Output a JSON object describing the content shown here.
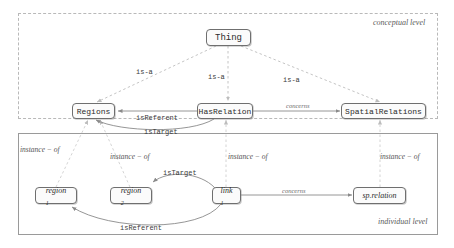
{
  "diagram": {
    "title_domain": "ontology-two-level-diagram",
    "colors": {
      "node_border": "#6f6f6f",
      "node_fill": "#fbfbfb",
      "solid_edge": "#8a8a8a",
      "dashed_edge": "#bdbdbd",
      "caption_text": "#5a5a5a",
      "label_text": "#3a3a3a"
    }
  },
  "levels": [
    {
      "id": "conceptual",
      "caption": "conceptual level",
      "border": "dashed"
    },
    {
      "id": "individual",
      "caption": "individual level",
      "border": "solid"
    }
  ],
  "conceptual": {
    "nodes": [
      {
        "id": "thing",
        "label": "Thing"
      },
      {
        "id": "regions",
        "label": "Regions"
      },
      {
        "id": "hasrelation",
        "label": "HasRelation"
      },
      {
        "id": "spatialrelations",
        "label": "SpatialRelations"
      }
    ],
    "edges": [
      {
        "id": "isa-regions",
        "label": "is-a",
        "style": "dashed",
        "from": "thing",
        "to": "regions"
      },
      {
        "id": "isa-hasrel",
        "label": "is-a",
        "style": "dashed",
        "from": "thing",
        "to": "hasrelation"
      },
      {
        "id": "isa-spatial",
        "label": "is-a",
        "style": "dashed",
        "from": "thing",
        "to": "spatialrelations"
      },
      {
        "id": "isreferent-c",
        "label": "isReferent",
        "style": "solid",
        "from": "hasrelation",
        "to": "regions"
      },
      {
        "id": "istarget-c",
        "label": "isTarget",
        "style": "solid",
        "from": "hasrelation",
        "to": "regions"
      },
      {
        "id": "concerns-c",
        "label": "concerns",
        "style": "solid",
        "from": "hasrelation",
        "to": "spatialrelations"
      }
    ]
  },
  "individual": {
    "nodes": [
      {
        "id": "region1",
        "label": "region",
        "sub": "1"
      },
      {
        "id": "region2",
        "label": "region",
        "sub": "2"
      },
      {
        "id": "link1",
        "label": "link",
        "sub": "1"
      },
      {
        "id": "sprelation",
        "label": "sp.relation",
        "sub": ""
      }
    ],
    "edges": [
      {
        "id": "istarget-i",
        "label": "isTarget",
        "style": "solid",
        "from": "link1",
        "to": "region2"
      },
      {
        "id": "isreferent-i",
        "label": "isReferent",
        "style": "solid",
        "from": "link1",
        "to": "region1"
      },
      {
        "id": "concerns-i",
        "label": "concerns",
        "style": "solid",
        "from": "link1",
        "to": "sprelation"
      }
    ]
  },
  "instance_edges": [
    {
      "id": "inst-region1",
      "label": "instance − of",
      "from": "region1",
      "to": "regions"
    },
    {
      "id": "inst-region2",
      "label": "instance − of",
      "from": "region2",
      "to": "regions"
    },
    {
      "id": "inst-link1",
      "label": "instance − of",
      "from": "link1",
      "to": "hasrelation"
    },
    {
      "id": "inst-sprelation",
      "label": "instance − of",
      "from": "sprelation",
      "to": "spatialrelations"
    }
  ]
}
